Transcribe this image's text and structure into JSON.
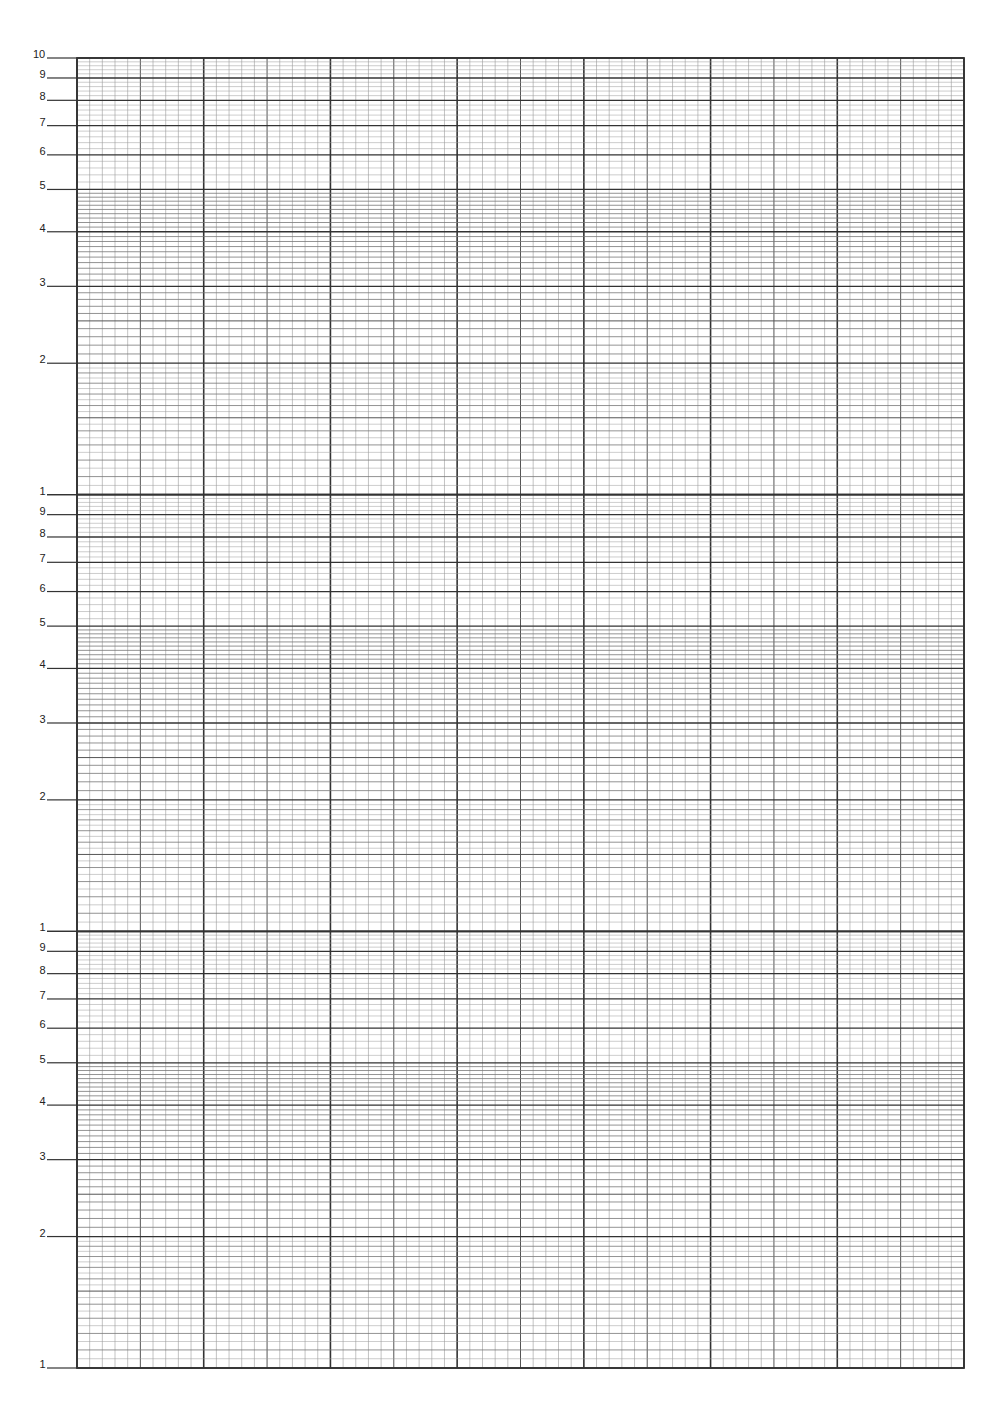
{
  "chart_data": {
    "type": "line",
    "title": "",
    "xlabel": "",
    "ylabel": "",
    "y_scale": "log",
    "y_cycles": 3,
    "ylim": [
      1,
      1000
    ],
    "x_scale": "linear",
    "x_major_divisions": 7,
    "x_minor_per_major": 10,
    "grid": true,
    "series": [],
    "y_tick_labels": [
      [
        "10",
        "9",
        "8",
        "7",
        "6",
        "5",
        "4",
        "3",
        "2"
      ],
      [
        "1",
        "9",
        "8",
        "7",
        "6",
        "5",
        "4",
        "3",
        "2"
      ],
      [
        "1",
        "9",
        "8",
        "7",
        "6",
        "5",
        "4",
        "3",
        "2",
        "1"
      ]
    ]
  },
  "layout": {
    "left": 77,
    "right": 964,
    "top": 58,
    "bottom": 1368,
    "tick_start_x": 47,
    "line_color": "#333333",
    "minor_color": "#9a9a9a"
  },
  "labels": [
    {
      "text": "10",
      "v": 10,
      "cycle": 0
    },
    {
      "text": "9",
      "v": 9,
      "cycle": 0
    },
    {
      "text": "8",
      "v": 8,
      "cycle": 0
    },
    {
      "text": "7",
      "v": 7,
      "cycle": 0
    },
    {
      "text": "6",
      "v": 6,
      "cycle": 0
    },
    {
      "text": "5",
      "v": 5,
      "cycle": 0
    },
    {
      "text": "4",
      "v": 4,
      "cycle": 0
    },
    {
      "text": "3",
      "v": 3,
      "cycle": 0
    },
    {
      "text": "2",
      "v": 2,
      "cycle": 0
    },
    {
      "text": "1",
      "v": 1,
      "cycle": 0
    },
    {
      "text": "9",
      "v": 9,
      "cycle": 1
    },
    {
      "text": "8",
      "v": 8,
      "cycle": 1
    },
    {
      "text": "7",
      "v": 7,
      "cycle": 1
    },
    {
      "text": "6",
      "v": 6,
      "cycle": 1
    },
    {
      "text": "5",
      "v": 5,
      "cycle": 1
    },
    {
      "text": "4",
      "v": 4,
      "cycle": 1
    },
    {
      "text": "3",
      "v": 3,
      "cycle": 1
    },
    {
      "text": "2",
      "v": 2,
      "cycle": 1
    },
    {
      "text": "1",
      "v": 1,
      "cycle": 1
    },
    {
      "text": "9",
      "v": 9,
      "cycle": 2
    },
    {
      "text": "8",
      "v": 8,
      "cycle": 2
    },
    {
      "text": "7",
      "v": 7,
      "cycle": 2
    },
    {
      "text": "6",
      "v": 6,
      "cycle": 2
    },
    {
      "text": "5",
      "v": 5,
      "cycle": 2
    },
    {
      "text": "4",
      "v": 4,
      "cycle": 2
    },
    {
      "text": "3",
      "v": 3,
      "cycle": 2
    },
    {
      "text": "2",
      "v": 2,
      "cycle": 2
    },
    {
      "text": "1",
      "v": 1,
      "cycle": 2
    }
  ]
}
